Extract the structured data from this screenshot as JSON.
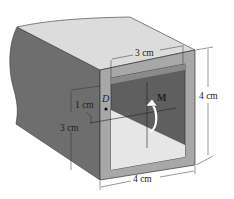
{
  "figure": {
    "labels": {
      "top_width": "3 cm",
      "right_height": "4 cm",
      "bottom_width": "4 cm",
      "left_offset": "1 cm",
      "left_height": "3 cm",
      "moment": "M",
      "point": "D"
    },
    "colors": {
      "top_face": "#d9d9d9",
      "side_face": "#6e6e6e",
      "frame_face": "#a9a9a9",
      "inner_dark": "#5f5f5f",
      "inner_light": "#e6e6e6",
      "dimension_line": "#333333"
    }
  }
}
